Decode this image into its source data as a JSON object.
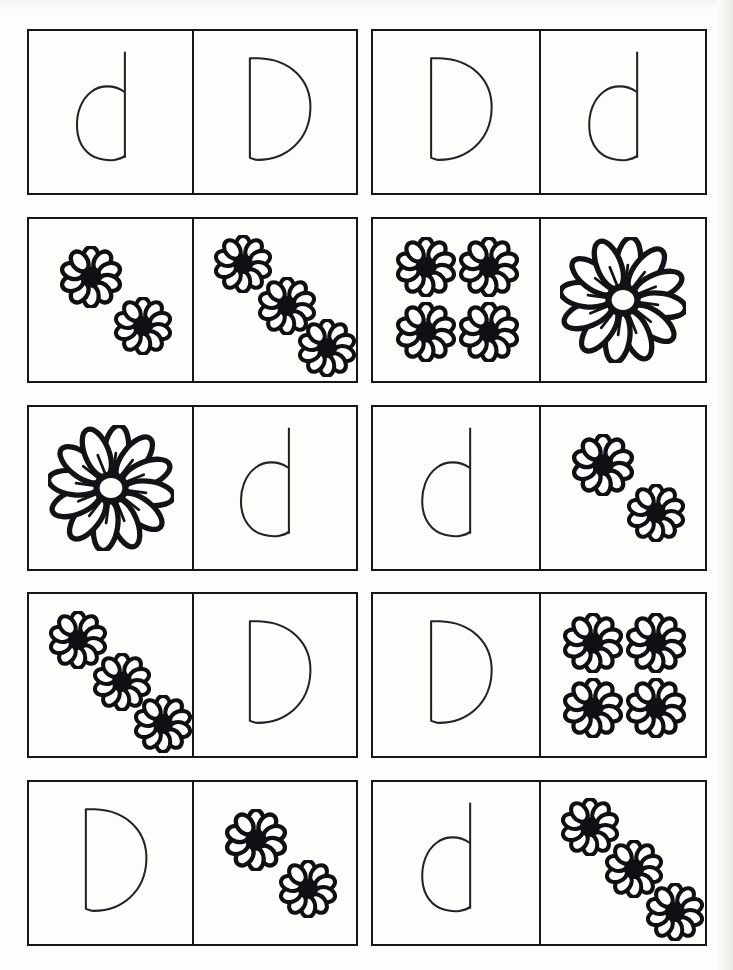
{
  "worksheet": {
    "title": "Letter D Matching Worksheet",
    "description": "Cut-and-match cards pairing the letter D with flower quantities",
    "background_color": "#fdfdfb",
    "ink_color": "#17171a",
    "columns": 4,
    "rows": 5,
    "card_pairs_per_row": 2
  },
  "icons": {
    "small_flower": "small-daisy-icon",
    "large_flower": "large-daisy-icon",
    "lowercase_d": "lowercase-d-glyph",
    "uppercase_d": "uppercase-d-glyph"
  },
  "rows": [
    {
      "index": 1,
      "cells": [
        {
          "type": "letter",
          "letter": "d",
          "case": "lowercase",
          "label": "lowercase d"
        },
        {
          "type": "letter",
          "letter": "D",
          "case": "uppercase",
          "label": "uppercase D"
        },
        {
          "type": "letter",
          "letter": "D",
          "case": "uppercase",
          "label": "uppercase D"
        },
        {
          "type": "letter",
          "letter": "d",
          "case": "lowercase",
          "label": "lowercase d"
        }
      ]
    },
    {
      "index": 2,
      "cells": [
        {
          "type": "flowers",
          "count": 2,
          "size": "small",
          "arrangement": "diagonal",
          "label": "two flowers"
        },
        {
          "type": "flowers",
          "count": 3,
          "size": "small",
          "arrangement": "diagonal",
          "label": "three flowers"
        },
        {
          "type": "flowers",
          "count": 4,
          "size": "small",
          "arrangement": "grid",
          "label": "four flowers"
        },
        {
          "type": "flowers",
          "count": 1,
          "size": "large",
          "arrangement": "center",
          "label": "one flower"
        }
      ]
    },
    {
      "index": 3,
      "cells": [
        {
          "type": "flowers",
          "count": 1,
          "size": "large",
          "arrangement": "center",
          "label": "one flower"
        },
        {
          "type": "letter",
          "letter": "d",
          "case": "lowercase",
          "label": "lowercase d"
        },
        {
          "type": "letter",
          "letter": "d",
          "case": "lowercase",
          "label": "lowercase d"
        },
        {
          "type": "flowers",
          "count": 2,
          "size": "small",
          "arrangement": "diagonal",
          "label": "two flowers"
        }
      ]
    },
    {
      "index": 4,
      "cells": [
        {
          "type": "flowers",
          "count": 3,
          "size": "small",
          "arrangement": "diagonal",
          "label": "three flowers"
        },
        {
          "type": "letter",
          "letter": "D",
          "case": "uppercase",
          "label": "uppercase D"
        },
        {
          "type": "letter",
          "letter": "D",
          "case": "uppercase",
          "label": "uppercase D"
        },
        {
          "type": "flowers",
          "count": 4,
          "size": "small",
          "arrangement": "grid",
          "label": "four flowers"
        }
      ]
    },
    {
      "index": 5,
      "cells": [
        {
          "type": "letter",
          "letter": "D",
          "case": "uppercase",
          "label": "uppercase D"
        },
        {
          "type": "flowers",
          "count": 2,
          "size": "small",
          "arrangement": "diagonal",
          "label": "two flowers"
        },
        {
          "type": "letter",
          "letter": "d",
          "case": "lowercase",
          "label": "lowercase d"
        },
        {
          "type": "flowers",
          "count": 3,
          "size": "small",
          "arrangement": "diagonal",
          "label": "three flowers"
        }
      ]
    }
  ],
  "layouts": {
    "diagonal_2": [
      {
        "x": 38,
        "y": 36,
        "size": 62
      },
      {
        "x": 70,
        "y": 66,
        "size": 58
      }
    ],
    "diagonal_3": [
      {
        "x": 30,
        "y": 28,
        "size": 58
      },
      {
        "x": 57,
        "y": 54,
        "size": 58
      },
      {
        "x": 82,
        "y": 80,
        "size": 58
      }
    ],
    "grid_4": [
      {
        "x": 32,
        "y": 30,
        "size": 60
      },
      {
        "x": 70,
        "y": 30,
        "size": 60
      },
      {
        "x": 32,
        "y": 70,
        "size": 60
      },
      {
        "x": 70,
        "y": 70,
        "size": 60
      }
    ],
    "center_1": [
      {
        "x": 50,
        "y": 50,
        "size": 126
      }
    ]
  }
}
